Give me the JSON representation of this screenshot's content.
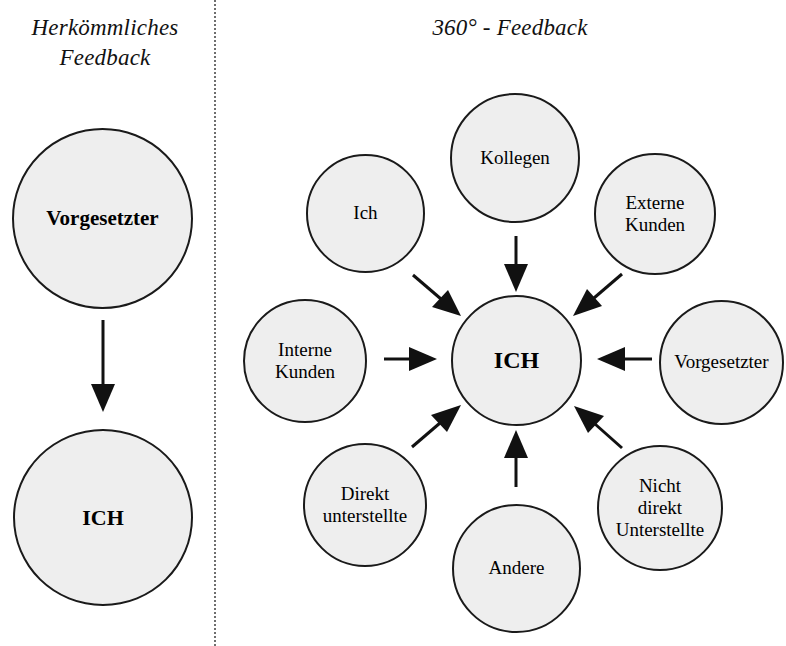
{
  "page": {
    "background_color": "#ffffff",
    "width": 786,
    "height": 646
  },
  "divider": {
    "style": "vertical-dotted",
    "color": "#6e6e6e"
  },
  "panels": {
    "traditional": {
      "title": "Herkömmliches\nFeedback",
      "nodes": {
        "supervisor": "Vorgesetzter",
        "self": "ICH"
      },
      "arrows": [
        {
          "from": "Vorgesetzter",
          "to": "ICH",
          "direction": "down"
        }
      ]
    },
    "feedback360": {
      "title": "360° - Feedback",
      "center_node": "ICH",
      "nodes": [
        {
          "id": "ich",
          "label": "Ich",
          "position": "upper-left"
        },
        {
          "id": "kollegen",
          "label": "Kollegen",
          "position": "top"
        },
        {
          "id": "externe-kunden",
          "label": "Externe\nKunden",
          "position": "upper-right"
        },
        {
          "id": "interne-kunden",
          "label": "Interne\nKunden",
          "position": "left"
        },
        {
          "id": "vorgesetzter",
          "label": "Vorgesetzter",
          "position": "right"
        },
        {
          "id": "direkt-unterstellte",
          "label": "Direkt\nunterstellte",
          "position": "lower-left"
        },
        {
          "id": "andere",
          "label": "Andere",
          "position": "bottom"
        },
        {
          "id": "nicht-direkt-unterstellte",
          "label": "Nicht\ndirekt\nUnterstellte",
          "position": "lower-right"
        }
      ],
      "arrows": [
        {
          "from": "Kollegen",
          "to": "ICH",
          "direction": "down"
        },
        {
          "from": "Externe Kunden",
          "to": "ICH",
          "direction": "down-left"
        },
        {
          "from": "Ich",
          "to": "ICH",
          "direction": "down-right"
        },
        {
          "from": "Interne Kunden",
          "to": "ICH",
          "direction": "right"
        },
        {
          "from": "Vorgesetzter",
          "to": "ICH",
          "direction": "left"
        },
        {
          "from": "Direkt unterstellte",
          "to": "ICH",
          "direction": "up-right"
        },
        {
          "from": "Andere",
          "to": "ICH",
          "direction": "up"
        },
        {
          "from": "Nicht direkt Unterstellte",
          "to": "ICH",
          "direction": "up-left"
        }
      ]
    }
  },
  "colors": {
    "circle_fill": "#eeeeee",
    "circle_stroke": "#1a1a1a",
    "arrow": "#111111",
    "text": "#000000"
  }
}
